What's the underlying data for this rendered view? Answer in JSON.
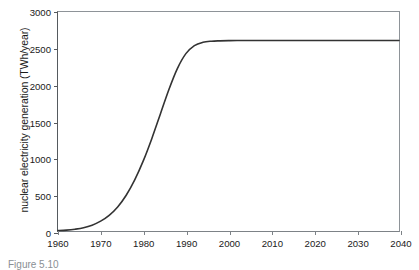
{
  "figure": {
    "caption": "Figure 5.10"
  },
  "chart_data": {
    "type": "line",
    "title": "",
    "xlabel": "",
    "ylabel": "nuclear electricity generation (TWh/year)",
    "xlim": [
      1960,
      2040
    ],
    "ylim": [
      0,
      3000
    ],
    "grid": false,
    "legend": false,
    "x_ticks": [
      1960,
      1970,
      1980,
      1990,
      2000,
      2010,
      2020,
      2030,
      2040
    ],
    "x_tick_labels": [
      "1960",
      "1970",
      "1980",
      "1990",
      "2000",
      "2010",
      "2020",
      "2030",
      "2040"
    ],
    "y_ticks": [
      0,
      500,
      1000,
      1500,
      2000,
      2500,
      3000
    ],
    "y_tick_labels": [
      "0",
      "500",
      "1000",
      "1500",
      "2000",
      "2500",
      "3000"
    ],
    "series": [
      {
        "name": "nuclear electricity generation",
        "color": "#333333",
        "x": [
          1960,
          1962,
          1964,
          1966,
          1968,
          1970,
          1972,
          1974,
          1976,
          1978,
          1980,
          1982,
          1984,
          1986,
          1988,
          1990,
          1992,
          1994,
          1996,
          1998,
          2000,
          2002,
          2004,
          2006,
          2008,
          2010,
          2015,
          2020,
          2025,
          2030,
          2035,
          2040
        ],
        "y": [
          5,
          12,
          25,
          45,
          80,
          135,
          215,
          330,
          490,
          700,
          960,
          1265,
          1600,
          1935,
          2225,
          2430,
          2540,
          2585,
          2600,
          2605,
          2608,
          2610,
          2610,
          2610,
          2610,
          2610,
          2610,
          2610,
          2610,
          2610,
          2610,
          2610
        ]
      }
    ]
  }
}
